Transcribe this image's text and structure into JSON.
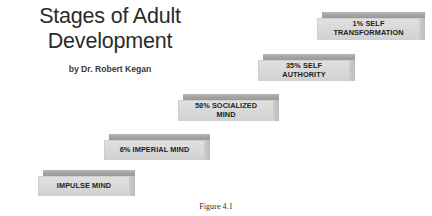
{
  "figure": {
    "title": "Stages of Adult\nDevelopment",
    "byline": "by Dr. Robert Kegan",
    "caption": "Figure 4.1"
  },
  "colors": {
    "background": "#ffffff",
    "step_front": "#dadada",
    "step_top_bevel": "#a2a2a2",
    "step_side": "#c3c3c3",
    "title_text": "#2b2b2b",
    "label_text": "#1d1d1d"
  },
  "chart_data": {
    "type": "bar",
    "title": "Stages of Adult Development",
    "categories": [
      "Impulse Mind",
      "Imperial Mind",
      "Socialized Mind",
      "Self Authority",
      "Self Transformation"
    ],
    "values": [
      null,
      6,
      58,
      35,
      1
    ],
    "value_unit": "percent of adult population",
    "xlabel": "",
    "ylabel": "",
    "grid": false,
    "legend": false,
    "note": "Ascending staircase of five 3D slabs; each slab is a developmental stage with its population percentage."
  },
  "steps": [
    {
      "id": "impulse-mind",
      "label": "IMPULSE MIND",
      "percent": null,
      "order": 1,
      "left": 38,
      "top": 170,
      "width": 92,
      "height": 26
    },
    {
      "id": "imperial-mind",
      "label": "6% IMPERIAL MIND",
      "percent": 6,
      "order": 2,
      "left": 104,
      "top": 134,
      "width": 101,
      "height": 26
    },
    {
      "id": "socialized-mind",
      "label": "58% SOCIALIZED\nMIND",
      "percent": 58,
      "order": 3,
      "left": 178,
      "top": 94,
      "width": 96,
      "height": 27
    },
    {
      "id": "self-authority",
      "label": "35% SELF\nAUTHORITY",
      "percent": 35,
      "order": 4,
      "left": 258,
      "top": 54,
      "width": 92,
      "height": 27
    },
    {
      "id": "self-transformation",
      "label": "1% SELF\nTRANSFORMATION",
      "percent": 1,
      "order": 5,
      "left": 317,
      "top": 12,
      "width": 103,
      "height": 28
    }
  ]
}
